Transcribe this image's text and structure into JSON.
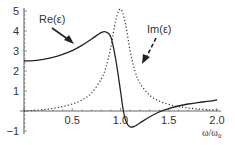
{
  "chart_data": {
    "type": "line",
    "title": "",
    "xlabel": "ω/ω0",
    "ylabel": "",
    "xlim": [
      0,
      2.0
    ],
    "ylim": [
      -1,
      5
    ],
    "grid": false,
    "legend": "inline annotations with arrows",
    "x_ticks": [
      0.5,
      1.0,
      1.5,
      2.0
    ],
    "x_tick_labels": [
      "0.5",
      "1.0",
      "1.5",
      "2.0"
    ],
    "y_ticks": [
      -1,
      1,
      2,
      3,
      4,
      5
    ],
    "y_tick_labels": [
      "−1",
      "1",
      "2",
      "3",
      "4",
      "5"
    ],
    "series": [
      {
        "name": "Re(ε)",
        "style": "solid",
        "x": [
          0.0,
          0.1,
          0.2,
          0.3,
          0.4,
          0.5,
          0.6,
          0.7,
          0.8,
          0.85,
          0.9,
          0.95,
          1.0,
          1.03,
          1.06,
          1.1,
          1.15,
          1.2,
          1.3,
          1.4,
          1.5,
          1.6,
          1.7,
          1.8,
          1.9,
          2.0
        ],
        "values": [
          2.5,
          2.52,
          2.58,
          2.68,
          2.83,
          3.02,
          3.28,
          3.6,
          3.92,
          3.95,
          3.7,
          2.6,
          1.0,
          0.0,
          -0.55,
          -0.8,
          -0.75,
          -0.6,
          -0.3,
          -0.05,
          0.12,
          0.25,
          0.35,
          0.42,
          0.48,
          0.55
        ]
      },
      {
        "name": "Im(ε)",
        "style": "dotted",
        "x": [
          0.0,
          0.1,
          0.2,
          0.3,
          0.4,
          0.5,
          0.6,
          0.7,
          0.8,
          0.85,
          0.9,
          0.95,
          1.0,
          1.05,
          1.1,
          1.15,
          1.2,
          1.3,
          1.4,
          1.5,
          1.6,
          1.7,
          1.8,
          1.9,
          2.0
        ],
        "values": [
          0.0,
          0.03,
          0.07,
          0.13,
          0.22,
          0.35,
          0.55,
          0.9,
          1.6,
          2.2,
          3.2,
          4.5,
          5.1,
          4.4,
          3.0,
          2.0,
          1.4,
          0.8,
          0.5,
          0.33,
          0.22,
          0.15,
          0.1,
          0.07,
          0.05
        ]
      }
    ],
    "annotations": [
      {
        "text": "Re(ε)",
        "arrow": "solid",
        "points_to": "Re(ε) curve near ω/ω0≈0.55"
      },
      {
        "text": "Im(ε)",
        "arrow": "dashed",
        "points_to": "Im(ε) curve near ω/ω0≈1.2"
      }
    ]
  },
  "labels": {
    "re": "Re(ε)",
    "im": "Im(ε)",
    "xaxis_main": "ω/ω",
    "xaxis_sub": "0"
  },
  "colors": {
    "line": "#222222",
    "axis": "#555555",
    "text": "#333333",
    "background": "#ffffff"
  }
}
